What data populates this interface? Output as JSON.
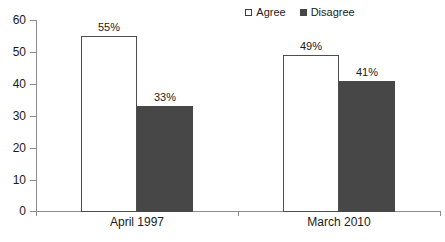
{
  "chart_data": {
    "type": "bar",
    "title": "",
    "subtitle": "",
    "xlabel": "",
    "ylabel": "",
    "categories": [
      "April 1997",
      "March 2010"
    ],
    "series": [
      {
        "name": "Agree",
        "values": [
          55,
          49
        ],
        "labels": [
          "55%",
          "41%"
        ],
        "color": "#ffffff",
        "border_color": "#4d4d4d",
        "marker": "hollow-square"
      },
      {
        "name": "Disagree",
        "values": [
          33,
          41
        ],
        "labels": [
          "33%",
          "41%"
        ],
        "color": "#474747",
        "border_color": "#474747",
        "marker": "filled-square"
      }
    ],
    "data_labels": [
      {
        "category": "April 1997",
        "series": "Agree",
        "value": 55,
        "text": "55%"
      },
      {
        "category": "April 1997",
        "series": "Disagree",
        "value": 33,
        "text": "33%"
      },
      {
        "category": "March 2010",
        "series": "Agree",
        "value": 49,
        "text": "49%"
      },
      {
        "category": "March 2010",
        "series": "Disagree",
        "value": 41,
        "text": "41%"
      }
    ],
    "ylim": [
      0,
      60
    ],
    "ytick_step": 10,
    "ytick_labels": [
      "0",
      "10",
      "20",
      "30",
      "40",
      "50",
      "60"
    ],
    "grid": false,
    "legend_position": "top-right",
    "axis_color": "#8c8c8c",
    "text_color": "#1a1a1a",
    "background": "#ffffff"
  },
  "legend": {
    "entries": [
      {
        "label": "Agree"
      },
      {
        "label": "Disagree"
      }
    ]
  },
  "axes": {
    "y": {
      "ticks": [
        {
          "label": "60",
          "value": 60
        },
        {
          "label": "50",
          "value": 50
        },
        {
          "label": "40",
          "value": 40
        },
        {
          "label": "30",
          "value": 30
        },
        {
          "label": "20",
          "value": 20
        },
        {
          "label": "10",
          "value": 10
        },
        {
          "label": "0",
          "value": 0
        }
      ]
    },
    "x": {
      "categories": [
        {
          "label": "April 1997"
        },
        {
          "label": "March 2010"
        }
      ]
    }
  }
}
